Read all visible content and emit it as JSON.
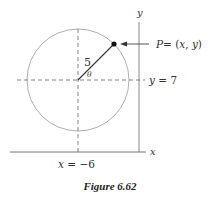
{
  "figure": {
    "caption": "Figure 6.62",
    "axes": {
      "x_label": "x",
      "y_label": "y"
    },
    "circle": {
      "radius_label": "5",
      "angle_label": "θ"
    },
    "point": {
      "label_P": "P",
      "label_eq": "= (",
      "label_x": "x",
      "label_comma": ", ",
      "label_y": "y",
      "label_close": ")"
    },
    "lines": {
      "horizontal_label_var": "y",
      "horizontal_label_eq": " = 7",
      "vertical_label_var": "x",
      "vertical_label_eq": " = −6"
    },
    "colors": {
      "axis": "#777777",
      "circle": "#888888",
      "dashed": "#666666",
      "radius": "#333333",
      "point": "#111111"
    }
  }
}
